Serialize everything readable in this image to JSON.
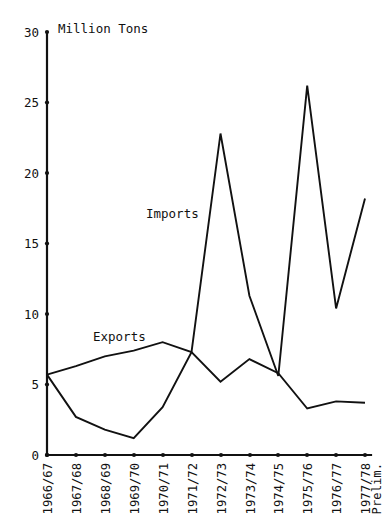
{
  "chart_data": {
    "type": "line",
    "title": "",
    "xlabel": "",
    "ylabel": "Million Tons",
    "ylim": [
      0,
      30
    ],
    "yticks": [
      0,
      5,
      10,
      15,
      20,
      25,
      30
    ],
    "grid": false,
    "legend_position": "inline-annotation",
    "categories": [
      "1966/67",
      "1967/68",
      "1968/69",
      "1969/70",
      "1970/71",
      "1971/72",
      "1972/73",
      "1973/74",
      "1974/75",
      "1975/76",
      "1976/77",
      "1977/78 Prelim."
    ],
    "series": [
      {
        "name": "Exports",
        "values": [
          5.7,
          6.3,
          7.0,
          7.4,
          8.0,
          7.3,
          5.2,
          6.8,
          5.8,
          3.3,
          3.8,
          3.7
        ]
      },
      {
        "name": "Imports",
        "values": [
          5.7,
          2.7,
          1.8,
          1.2,
          3.4,
          7.3,
          22.8,
          11.3,
          5.6,
          26.2,
          10.4,
          18.2
        ]
      }
    ],
    "annotations": [
      {
        "text": "Imports",
        "x_px": 146,
        "y_px": 218
      },
      {
        "text": "Exports",
        "x_px": 93,
        "y_px": 341
      }
    ]
  },
  "axis": {
    "y_unit_label": "Million Tons",
    "tick_labels": {
      "t30": "30",
      "t25": "25",
      "t20": "20",
      "t15": "15",
      "t10": "10",
      "t5": "5",
      "t0": "0"
    }
  },
  "xlabels": {
    "x0": "1966/67",
    "x1": "1967/68",
    "x2": "1968/69",
    "x3": "1969/70",
    "x4": "1970/71",
    "x5": "1971/72",
    "x6": "1972/73",
    "x7": "1973/74",
    "x8": "1974/75",
    "x9": "1975/76",
    "x10": "1976/77",
    "x11a": "1977/78",
    "x11b": "Prelim."
  },
  "series_labels": {
    "imports": "Imports",
    "exports": "Exports"
  },
  "colors": {
    "ink": "#111111",
    "background": "#ffffff"
  }
}
